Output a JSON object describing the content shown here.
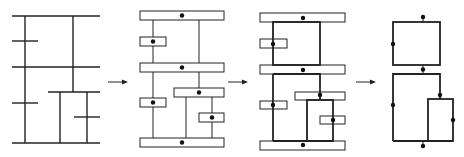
{
  "diagram": {
    "stroke_color": "#222222",
    "background": "#ffffff",
    "stages": [
      {
        "id": "stage-1",
        "label": "original line network"
      },
      {
        "id": "stage-2",
        "label": "lines replaced by boxed nodes"
      },
      {
        "id": "stage-3",
        "label": "nodes connected with thick edges"
      },
      {
        "id": "stage-4",
        "label": "reduced loop graph"
      }
    ],
    "arrows": [
      {
        "from": "stage-1",
        "to": "stage-2"
      },
      {
        "from": "stage-2",
        "to": "stage-3"
      },
      {
        "from": "stage-3",
        "to": "stage-4"
      }
    ]
  }
}
